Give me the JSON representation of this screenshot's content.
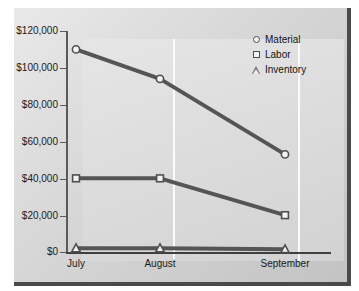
{
  "chart_data": {
    "type": "line",
    "title": "",
    "xlabel": "",
    "ylabel": "",
    "categories": [
      "July",
      "August",
      "September"
    ],
    "series": [
      {
        "name": "Material",
        "marker": "circle",
        "values": [
          110000,
          94000,
          53000
        ]
      },
      {
        "name": "Labor",
        "marker": "square",
        "values": [
          40000,
          40000,
          20000
        ]
      },
      {
        "name": "Inventory",
        "marker": "triangle",
        "values": [
          2000,
          2000,
          1500
        ]
      }
    ],
    "ylim": [
      0,
      120000
    ],
    "ytick_labels": [
      "$120,000",
      "$100,000",
      "$80,000",
      "$60,000",
      "$40,000",
      "$20,000",
      "$0"
    ],
    "ytick_values": [
      120000,
      100000,
      80000,
      60000,
      40000,
      20000,
      0
    ],
    "grid": "vertical",
    "legend_position": "top-right",
    "colors": {
      "line": "#555555",
      "marker_fill": "#f2f2f2",
      "marker_edge": "#4e4e4e",
      "panel_background": "#dedede",
      "gridline": "#fbfbfb",
      "axis": "#4a4a4a",
      "text": "#1a1a1a"
    }
  },
  "legend": {
    "items": [
      {
        "label": "Material",
        "icon": "circle-marker-icon"
      },
      {
        "label": "Labor",
        "icon": "square-marker-icon"
      },
      {
        "label": "Inventory",
        "icon": "triangle-marker-icon"
      }
    ]
  }
}
